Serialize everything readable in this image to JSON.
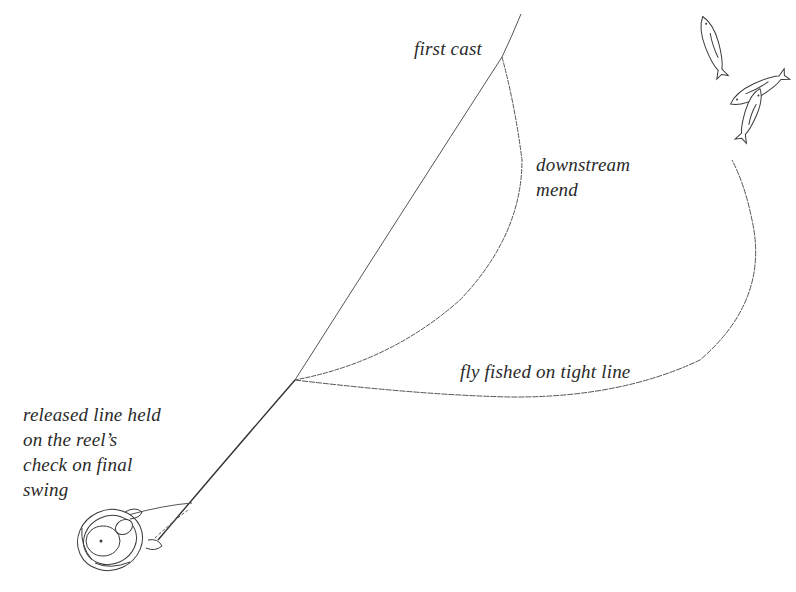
{
  "diagram": {
    "type": "illustration",
    "labels": {
      "first_cast": "first cast",
      "downstream_mend": [
        "downstream",
        "mend"
      ],
      "fly_fished": "fly fished on tight line",
      "released_line": [
        "released line held",
        "on the reel’s",
        "check on final",
        "swing"
      ]
    },
    "icons": [
      "fish-icon",
      "fish-icon",
      "fish-icon",
      "angler-reel-icon"
    ],
    "colors": {
      "background": "#ffffff",
      "ink": "#3a3a3a",
      "text": "#2a2a2a"
    }
  }
}
